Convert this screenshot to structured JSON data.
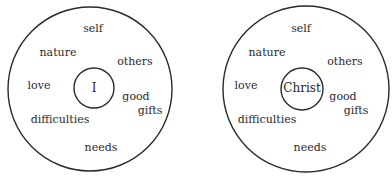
{
  "diagrams": [
    {
      "center_label": "I",
      "labels": {
        "self": "self",
        "nature": "nature",
        "others": "others",
        "love": "love",
        "good": "good",
        "gifts": "gifts",
        "difficulties": "difficulties",
        "needs": "needs"
      }
    },
    {
      "center_label": "Christ",
      "labels": {
        "self": "self",
        "nature": "nature",
        "others": "others",
        "love": "love",
        "good": "good",
        "gifts": "gifts",
        "difficulties": "difficulties",
        "needs": "needs"
      }
    }
  ],
  "colors": {
    "stroke": "#2a2a2a",
    "text": "#2a2a2a",
    "background": "#ffffff"
  }
}
